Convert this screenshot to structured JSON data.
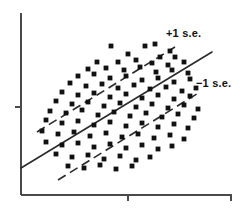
{
  "chart_data": {
    "type": "scatter",
    "title": "",
    "subtitle": "",
    "xlabel": "",
    "ylabel": "",
    "xlim": [
      0,
      100
    ],
    "ylim": [
      0,
      100
    ],
    "grid": false,
    "legend_position": "none",
    "annotations": [
      {
        "id": "upper-se",
        "text": "+1 s.e.",
        "x": 166,
        "y": 28
      },
      {
        "id": "lower-se",
        "text": "−1 s.e.",
        "x": 196,
        "y": 78
      }
    ],
    "axes": {
      "origin": {
        "x": 21,
        "y": 195
      },
      "y_axis_top": 13,
      "x_axis_right": 232,
      "y_ticks": [
        107
      ],
      "x_ticks": [
        128,
        231
      ],
      "tick_length": 6,
      "axis_color": "#4a4a4a",
      "axis_width": 2
    },
    "series": [
      {
        "name": "observations",
        "type": "scatter",
        "marker": "square",
        "marker_size": 2.4,
        "color": "#111111",
        "points": [
          [
            111,
            46
          ],
          [
            145,
            46
          ],
          [
            155,
            44
          ],
          [
            170,
            51
          ],
          [
            128,
            54
          ],
          [
            160,
            57
          ],
          [
            175,
            57
          ],
          [
            97,
            62
          ],
          [
            118,
            62
          ],
          [
            136,
            60
          ],
          [
            152,
            63
          ],
          [
            168,
            65
          ],
          [
            184,
            62
          ],
          [
            88,
            69
          ],
          [
            106,
            68
          ],
          [
            124,
            70
          ],
          [
            140,
            67
          ],
          [
            156,
            72
          ],
          [
            172,
            70
          ],
          [
            188,
            73
          ],
          [
            78,
            76
          ],
          [
            94,
            74
          ],
          [
            110,
            78
          ],
          [
            126,
            76
          ],
          [
            142,
            80
          ],
          [
            158,
            78
          ],
          [
            174,
            82
          ],
          [
            190,
            79
          ],
          [
            70,
            83
          ],
          [
            86,
            86
          ],
          [
            102,
            84
          ],
          [
            118,
            88
          ],
          [
            134,
            85
          ],
          [
            150,
            89
          ],
          [
            166,
            87
          ],
          [
            182,
            91
          ],
          [
            196,
            88
          ],
          [
            62,
            92
          ],
          [
            78,
            95
          ],
          [
            94,
            93
          ],
          [
            110,
            97
          ],
          [
            126,
            94
          ],
          [
            142,
            98
          ],
          [
            158,
            95
          ],
          [
            174,
            99
          ],
          [
            190,
            96
          ],
          [
            56,
            101
          ],
          [
            72,
            104
          ],
          [
            88,
            102
          ],
          [
            104,
            106
          ],
          [
            120,
            103
          ],
          [
            136,
            107
          ],
          [
            152,
            104
          ],
          [
            168,
            108
          ],
          [
            184,
            105
          ],
          [
            198,
            109
          ],
          [
            50,
            111
          ],
          [
            66,
            113
          ],
          [
            82,
            110
          ],
          [
            98,
            115
          ],
          [
            114,
            112
          ],
          [
            130,
            116
          ],
          [
            146,
            113
          ],
          [
            162,
            117
          ],
          [
            178,
            114
          ],
          [
            194,
            118
          ],
          [
            46,
            120
          ],
          [
            62,
            123
          ],
          [
            78,
            121
          ],
          [
            94,
            125
          ],
          [
            110,
            122
          ],
          [
            126,
            126
          ],
          [
            142,
            123
          ],
          [
            158,
            127
          ],
          [
            174,
            124
          ],
          [
            188,
            128
          ],
          [
            42,
            131
          ],
          [
            58,
            134
          ],
          [
            74,
            132
          ],
          [
            90,
            136
          ],
          [
            106,
            133
          ],
          [
            122,
            137
          ],
          [
            138,
            134
          ],
          [
            154,
            138
          ],
          [
            170,
            135
          ],
          [
            184,
            139
          ],
          [
            46,
            142
          ],
          [
            62,
            145
          ],
          [
            78,
            143
          ],
          [
            94,
            147
          ],
          [
            110,
            144
          ],
          [
            126,
            148
          ],
          [
            142,
            145
          ],
          [
            158,
            149
          ],
          [
            172,
            146
          ],
          [
            56,
            154
          ],
          [
            72,
            157
          ],
          [
            88,
            155
          ],
          [
            104,
            159
          ],
          [
            120,
            156
          ],
          [
            136,
            160
          ],
          [
            150,
            157
          ],
          [
            68,
            166
          ],
          [
            84,
            168
          ],
          [
            100,
            165
          ],
          [
            116,
            169
          ],
          [
            132,
            166
          ]
        ]
      }
    ],
    "fit_line": {
      "name": "regression-line",
      "style": "solid",
      "color": "#2b2b2b",
      "width": 1.6,
      "x1": 21,
      "y1": 168,
      "x2": 212,
      "y2": 52
    },
    "confidence_bands": [
      {
        "name": "upper-se-line",
        "label": "+1 s.e.",
        "style": "dashed",
        "color": "#2b2b2b",
        "width": 1.6,
        "dash": "9 5",
        "x1": 37,
        "y1": 132,
        "x2": 175,
        "y2": 47
      },
      {
        "name": "lower-se-line",
        "label": "−1 s.e.",
        "style": "dashed",
        "color": "#2b2b2b",
        "width": 1.6,
        "dash": "9 5",
        "x1": 58,
        "y1": 180,
        "x2": 200,
        "y2": 92
      }
    ]
  }
}
